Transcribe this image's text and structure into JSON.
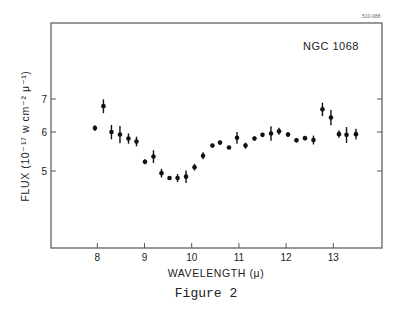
{
  "plate_number": "510-088",
  "caption": "Figure 2",
  "chart_data": {
    "type": "scatter",
    "title": "NGC 1068",
    "xlabel": "WAVELENGTH (μ)",
    "ylabel": "FLUX (10⁻¹⁷ w cm⁻² μ⁻¹)",
    "yscale": "log",
    "xlim": [
      7.1,
      14.1
    ],
    "ylim": [
      2.61,
      9.6
    ],
    "xticks": [
      8,
      9,
      10,
      11,
      12,
      13
    ],
    "xtick_labels": [
      "8",
      "9",
      "10",
      "11",
      "12",
      "13"
    ],
    "yticks": [
      5,
      6,
      7
    ],
    "ytick_labels": [
      "5",
      "6",
      "7"
    ],
    "grid": false,
    "legend": null,
    "series": [
      {
        "name": "NGC 1068",
        "marker": "filled-circle",
        "error_bars": true,
        "x": [
          7.95,
          8.13,
          8.3,
          8.48,
          8.66,
          8.83,
          9.01,
          9.19,
          9.36,
          9.53,
          9.7,
          9.88,
          10.06,
          10.24,
          10.44,
          10.6,
          10.79,
          10.96,
          11.14,
          11.33,
          11.5,
          11.68,
          11.85,
          12.04,
          12.22,
          12.4,
          12.58,
          12.77,
          12.95,
          13.12,
          13.28,
          13.48
        ],
        "y": [
          6.11,
          6.77,
          6.0,
          5.93,
          5.82,
          5.74,
          5.22,
          5.35,
          4.95,
          4.84,
          4.84,
          4.87,
          5.09,
          5.37,
          5.63,
          5.71,
          5.58,
          5.84,
          5.63,
          5.82,
          5.92,
          5.96,
          6.02,
          5.93,
          5.77,
          5.83,
          5.78,
          6.67,
          6.42,
          5.94,
          5.92,
          5.94
        ],
        "y_err_low": [
          0.08,
          0.22,
          0.2,
          0.24,
          0.14,
          0.13,
          0.06,
          0.16,
          0.1,
          0.0,
          0.09,
          0.14,
          0.08,
          0.09,
          0.02,
          0.05,
          0.04,
          0.16,
          0.08,
          0.06,
          0.04,
          0.2,
          0.1,
          0.07,
          0.05,
          0.06,
          0.12,
          0.21,
          0.23,
          0.1,
          0.22,
          0.15
        ],
        "y_err_high": [
          0.08,
          0.22,
          0.2,
          0.24,
          0.14,
          0.13,
          0.06,
          0.16,
          0.1,
          0.0,
          0.09,
          0.14,
          0.08,
          0.09,
          0.02,
          0.05,
          0.04,
          0.16,
          0.08,
          0.06,
          0.04,
          0.2,
          0.1,
          0.07,
          0.05,
          0.06,
          0.12,
          0.21,
          0.23,
          0.1,
          0.22,
          0.15
        ]
      }
    ]
  }
}
